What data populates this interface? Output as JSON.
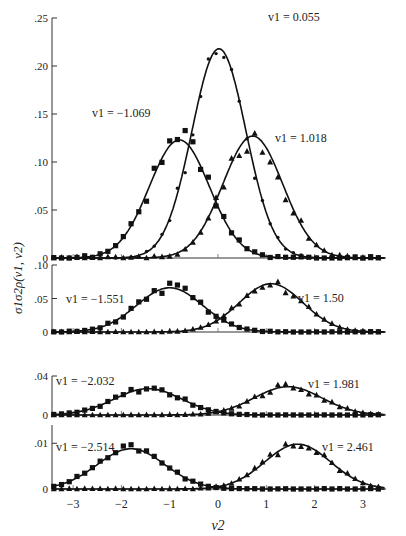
{
  "chart_data": {
    "type": "line",
    "xlabel": "v2",
    "ylabel": "σ1σ2ρ(v1, v2)",
    "x_ticks": [
      -3,
      -2,
      -1,
      0,
      1,
      2,
      3
    ],
    "xlim": [
      -3.45,
      3.45
    ],
    "panels": [
      {
        "name": "panel-1",
        "ylim": [
          0,
          0.25
        ],
        "y_ticks": [
          0,
          0.05,
          0.1,
          0.15,
          0.2,
          0.25
        ],
        "y_tick_labels": [
          "0",
          ".05",
          ".10",
          ".15",
          ".20",
          ".25"
        ],
        "series": [
          {
            "name": "v1 = -1.069",
            "label": "v1 = −1.069",
            "marker": "square",
            "fit_mean": -0.8,
            "fit_sd": 0.62,
            "fit_peak": 0.123
          },
          {
            "name": "v1 = 0.055",
            "label": "v1 = 0.055",
            "marker": "dot",
            "fit_mean": 0.02,
            "fit_sd": 0.56,
            "fit_peak": 0.218
          },
          {
            "name": "v1 = 1.018",
            "label": "v1 = 1.018",
            "marker": "triangle",
            "fit_mean": 0.72,
            "fit_sd": 0.62,
            "fit_peak": 0.127
          }
        ]
      },
      {
        "name": "panel-2",
        "ylim": [
          0,
          0.1
        ],
        "y_ticks": [
          0,
          0.05,
          0.1
        ],
        "y_tick_labels": [
          "0",
          ".05",
          ".10"
        ],
        "series": [
          {
            "name": "v1 = -1.551",
            "label": "v1 = −1.551",
            "marker": "square",
            "fit_mean": -1.0,
            "fit_sd": 0.68,
            "fit_peak": 0.066
          },
          {
            "name": "v1 = 1.50",
            "label": "v1 = 1.50",
            "marker": "triangle",
            "fit_mean": 1.1,
            "fit_sd": 0.66,
            "fit_peak": 0.072
          }
        ]
      },
      {
        "name": "panel-3",
        "ylim": [
          0,
          0.04
        ],
        "y_ticks": [
          0,
          0.04
        ],
        "y_tick_labels": [
          "0",
          ".04"
        ],
        "series": [
          {
            "name": "v1 = -2.032",
            "label": "v1 = −2.032",
            "marker": "square",
            "fit_mean": -1.45,
            "fit_sd": 0.7,
            "fit_peak": 0.027
          },
          {
            "name": "v1 = 1.981",
            "label": "v1 = 1.981",
            "marker": "triangle",
            "fit_mean": 1.45,
            "fit_sd": 0.7,
            "fit_peak": 0.029
          }
        ]
      },
      {
        "name": "panel-4",
        "ylim": [
          0,
          0.014
        ],
        "y_ticks": [
          0,
          0.01
        ],
        "y_tick_labels": [
          "0",
          ".01"
        ],
        "series": [
          {
            "name": "v1 = -2.514",
            "label": "v1 = −2.514",
            "marker": "square",
            "fit_mean": -1.8,
            "fit_sd": 0.7,
            "fit_peak": 0.0088
          },
          {
            "name": "v1 = 2.461",
            "label": "v1 = 2.461",
            "marker": "triangle",
            "fit_mean": 1.65,
            "fit_sd": 0.68,
            "fit_peak": 0.0098
          }
        ]
      }
    ],
    "legend_position": "inline labels near curves",
    "grid": false
  }
}
